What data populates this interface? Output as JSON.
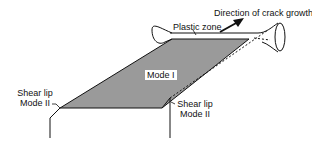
{
  "labels": {
    "direction": "Direction of crack growth",
    "plastic_zone": "Plastic zone",
    "mode_i": "Mode I",
    "shear_lip_left_1": "Shear lip",
    "shear_lip_left_2": "Mode II",
    "shear_lip_right_1": "Shear lip",
    "shear_lip_right_2": "Mode II"
  },
  "colors": {
    "fracture_surface": "#9a9a9a",
    "lines": "#111111",
    "background": "#ffffff"
  }
}
